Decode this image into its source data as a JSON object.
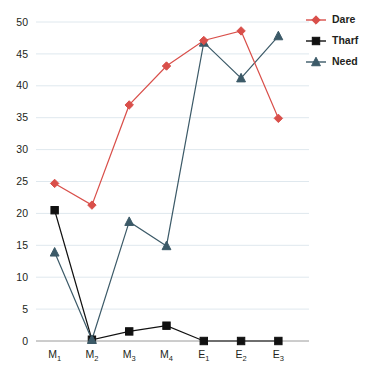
{
  "chart_data": {
    "type": "line",
    "title": "",
    "xlabel": "",
    "ylabel": "",
    "categories": [
      "M1",
      "M2",
      "M3",
      "M4",
      "E1",
      "E2",
      "E3"
    ],
    "category_labels": [
      {
        "base": "M",
        "sub": "1"
      },
      {
        "base": "M",
        "sub": "2"
      },
      {
        "base": "M",
        "sub": "3"
      },
      {
        "base": "M",
        "sub": "4"
      },
      {
        "base": "E",
        "sub": "1"
      },
      {
        "base": "E",
        "sub": "2"
      },
      {
        "base": "E",
        "sub": "3"
      }
    ],
    "ylim": [
      0,
      50
    ],
    "yticks": [
      0,
      5,
      10,
      15,
      20,
      25,
      30,
      35,
      40,
      45,
      50
    ],
    "ytick_labels": [
      "0",
      "5",
      "10",
      "15",
      "20",
      "25",
      "30",
      "35",
      "40",
      "45",
      "50"
    ],
    "grid": true,
    "legend_position": "right",
    "series": [
      {
        "name": "Dare",
        "color": "#d94f4a",
        "marker": "diamond",
        "values": [
          24.7,
          21.3,
          37.0,
          43.1,
          47.1,
          48.6,
          34.9
        ]
      },
      {
        "name": "Tharf",
        "color": "#111111",
        "marker": "square",
        "values": [
          20.5,
          0.2,
          1.5,
          2.4,
          0.0,
          0.0,
          0.0
        ]
      },
      {
        "name": "Need",
        "color": "#3b5c६6",
        "marker": "triangle",
        "values": [
          13.9,
          0.2,
          18.7,
          14.9,
          46.8,
          41.2,
          47.8
        ]
      }
    ]
  },
  "legend": {
    "items": [
      {
        "label": "Dare",
        "color": "#d94f4a",
        "marker": "diamond"
      },
      {
        "label": "Tharf",
        "color": "#111111",
        "marker": "square"
      },
      {
        "label": "Need",
        "color": "#3c5a68",
        "marker": "triangle"
      }
    ]
  },
  "colors": {
    "dare": "#d94f4a",
    "tharf": "#111111",
    "need": "#3c5a68",
    "gridline": "#dfe8ee",
    "axis": "#9a9a9a",
    "text": "#231f20",
    "background": "#ffffff"
  }
}
